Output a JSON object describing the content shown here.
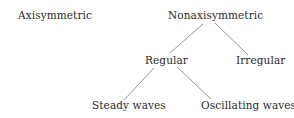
{
  "diagram": {
    "type": "tree",
    "nodes": [
      {
        "id": "axisymmetric",
        "label": "Axisymmetric",
        "x": 18,
        "y": 9,
        "w": 66
      },
      {
        "id": "nonaxisymmetric",
        "label": "Nonaxisymmetric",
        "x": 168,
        "y": 9,
        "w": 82
      },
      {
        "id": "regular",
        "label": "Regular",
        "x": 145,
        "y": 54,
        "w": 38
      },
      {
        "id": "irregular",
        "label": "Irregular",
        "x": 236,
        "y": 54,
        "w": 42
      },
      {
        "id": "steady_waves",
        "label": "Steady waves",
        "x": 92,
        "y": 99,
        "w": 64
      },
      {
        "id": "oscillating_waves",
        "label": "Oscillating waves",
        "x": 201,
        "y": 99,
        "w": 80
      }
    ],
    "edges": [
      {
        "from": "nonaxisymmetric",
        "to": "regular",
        "x1": 203,
        "y1": 24,
        "x2": 170,
        "y2": 53
      },
      {
        "from": "nonaxisymmetric",
        "to": "irregular",
        "x1": 215,
        "y1": 23,
        "x2": 248,
        "y2": 55
      },
      {
        "from": "regular",
        "to": "steady_waves",
        "x1": 154,
        "y1": 68,
        "x2": 124,
        "y2": 100
      },
      {
        "from": "regular",
        "to": "oscillating_waves",
        "x1": 177,
        "y1": 67,
        "x2": 211,
        "y2": 99
      }
    ],
    "colors": {
      "text": "#2a2a2a",
      "line": "#8a8a8a",
      "background": "#ffffff"
    }
  }
}
